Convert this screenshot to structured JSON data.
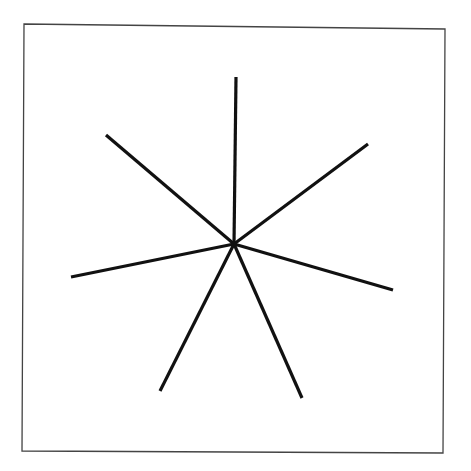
{
  "canvas": {
    "width": 471,
    "height": 471,
    "background": "#ffffff"
  },
  "frame": {
    "corners": [
      [
        24,
        24
      ],
      [
        445,
        29
      ],
      [
        443,
        453
      ],
      [
        22,
        451
      ]
    ],
    "stroke": "#444444",
    "stroke_width": 1.3
  },
  "star": {
    "center": [
      234,
      244
    ],
    "ray_count": 7,
    "stroke": "#111111",
    "stroke_width": 3.2,
    "rays": [
      {
        "name": "ray-top",
        "end": [
          236,
          77
        ]
      },
      {
        "name": "ray-upper-right",
        "end": [
          368,
          144
        ]
      },
      {
        "name": "ray-right",
        "end": [
          393,
          290
        ]
      },
      {
        "name": "ray-lower-right",
        "end": [
          302,
          398
        ]
      },
      {
        "name": "ray-lower-left",
        "end": [
          160,
          391
        ]
      },
      {
        "name": "ray-left",
        "end": [
          71,
          277
        ]
      },
      {
        "name": "ray-upper-left",
        "end": [
          106,
          135
        ]
      }
    ]
  }
}
